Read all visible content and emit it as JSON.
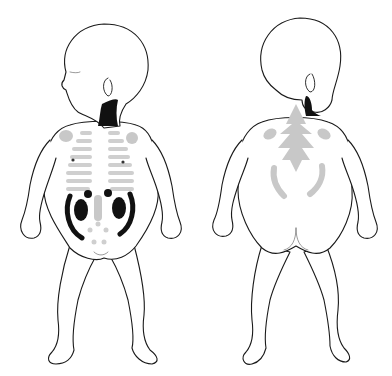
{
  "figure": {
    "colors": {
      "outline": "#1a1a1a",
      "dark_region": "#111111",
      "light_region": "#c8c8c8",
      "background": "#ffffff"
    },
    "views": [
      {
        "name": "anterior",
        "regions": [
          "neck (dark)",
          "clavicle/shoulder (light)",
          "rib cage bars (light)",
          "kidneys (dark)",
          "flank arcs (dark)",
          "spleen/liver dots (dark)",
          "midline spine (light)",
          "pelvic dots (light)"
        ]
      },
      {
        "name": "posterior",
        "regions": [
          "neck (dark)",
          "spine arrows (light)",
          "scapulae (light)",
          "lower flank arcs (light)"
        ]
      }
    ]
  }
}
